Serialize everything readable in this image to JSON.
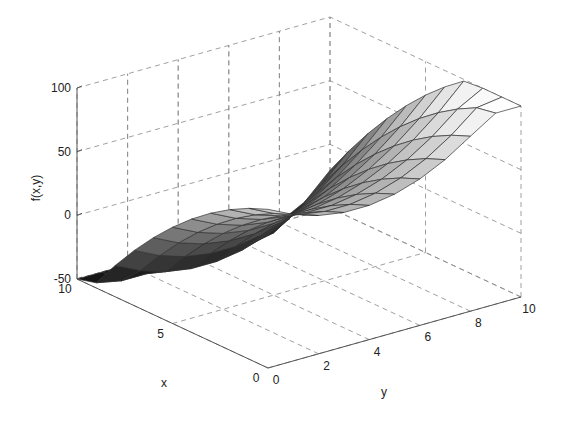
{
  "chart_data": {
    "type": "surface",
    "title": "",
    "xlabel": "x",
    "ylabel": "y",
    "zlabel": "f(x,y)",
    "xlim": [
      0,
      10
    ],
    "ylim": [
      0,
      10
    ],
    "zlim": [
      -50,
      100
    ],
    "x_ticks": [
      0,
      5,
      10
    ],
    "y_ticks": [
      0,
      2,
      4,
      6,
      8,
      10
    ],
    "z_ticks": [
      -50,
      0,
      50,
      100
    ],
    "grid": true,
    "colormap": "gray",
    "grid_x": [
      0,
      1,
      2,
      3,
      4,
      5,
      6,
      7,
      8,
      9,
      10
    ],
    "grid_y": [
      0,
      1,
      2,
      3,
      4,
      5,
      6,
      7,
      8,
      9,
      10
    ],
    "function_description": "parabolic surface, minimum near x=10,y~3, rising to ~100 at x=0"
  },
  "labels": {
    "x": "x",
    "y": "y",
    "z": "f(x,y)",
    "x_tick_labels": [
      "0",
      "5",
      "10"
    ],
    "y_tick_labels": [
      "0",
      "2",
      "4",
      "6",
      "8",
      "10"
    ],
    "z_tick_labels": [
      "-50",
      "0",
      "50",
      "100"
    ]
  }
}
